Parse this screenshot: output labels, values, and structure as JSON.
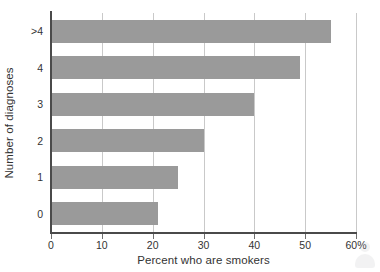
{
  "chart_data": {
    "type": "bar",
    "orientation": "horizontal",
    "title": "",
    "xlabel": "Percent who are smokers",
    "ylabel": "Number of diagnoses",
    "categories": [
      ">4",
      "4",
      "3",
      "2",
      "1",
      "0"
    ],
    "values": [
      55,
      49,
      40,
      30,
      25,
      21
    ],
    "xlim": [
      0,
      60
    ],
    "xticks": [
      0,
      10,
      20,
      30,
      40,
      50,
      60
    ],
    "xticklabels": [
      "0",
      "10",
      "20",
      "30",
      "40",
      "50",
      "60%"
    ],
    "grid": "vertical",
    "legend": "none",
    "bar_color": "#9a9a9a",
    "axis_color": "#4a4a4a",
    "gridline_color": "#c9c9c9"
  },
  "watermark": {
    "icon": "person-silhouette-icon"
  }
}
